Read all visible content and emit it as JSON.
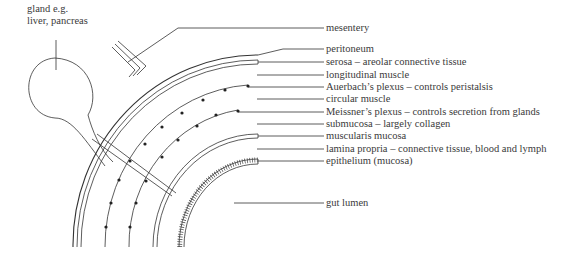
{
  "diagram": {
    "gland_label_line1": "gland e.g.",
    "gland_label_line2": "liver, pancreas",
    "labels": [
      {
        "id": "mesentery",
        "text": "mesentery"
      },
      {
        "id": "peritoneum",
        "text": "peritoneum"
      },
      {
        "id": "serosa",
        "text": "serosa – areolar connective tissue"
      },
      {
        "id": "longitudinal",
        "text": "longitudinal muscle"
      },
      {
        "id": "auerbach",
        "text": "Auerbach’s plexus – controls peristalsis"
      },
      {
        "id": "circular",
        "text": "circular muscle"
      },
      {
        "id": "meissner",
        "text": "Meissner’s plexus – controls secretion from glands"
      },
      {
        "id": "submucosa",
        "text": "submucosa – largely collagen"
      },
      {
        "id": "muscularis",
        "text": "muscularis mucosa"
      },
      {
        "id": "lamina",
        "text": "lamina propria – connective tissue, blood and lymph"
      },
      {
        "id": "epithelium",
        "text": "epithelium (mucosa)"
      },
      {
        "id": "lumen",
        "text": "gut lumen"
      }
    ],
    "colors": {
      "line": "#333333",
      "text": "#3a3a3a"
    }
  }
}
